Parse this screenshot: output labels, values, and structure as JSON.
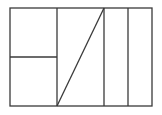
{
  "diagram": {
    "stroke_color": "#3a3a3a",
    "background": "#ffffff",
    "outer_rect": {
      "x": 10,
      "y": 8,
      "width": 142,
      "height": 98
    },
    "lines": {
      "v1": {
        "x1": 57,
        "y1": 8,
        "x2": 57,
        "y2": 106
      },
      "v2": {
        "x1": 104,
        "y1": 8,
        "x2": 104,
        "y2": 106
      },
      "v3": {
        "x1": 128,
        "y1": 8,
        "x2": 128,
        "y2": 106
      },
      "h1": {
        "x1": 10,
        "y1": 57,
        "x2": 57,
        "y2": 57
      },
      "diag": {
        "x1": 57,
        "y1": 106,
        "x2": 104,
        "y2": 8
      }
    }
  }
}
